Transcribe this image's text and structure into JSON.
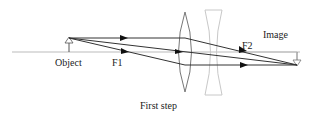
{
  "diagram": {
    "type": "optics-ray-diagram",
    "caption": "First step",
    "labels": {
      "object": "Object",
      "focal_1": "F1",
      "focal_2": "F2",
      "image": "Image"
    },
    "elements": [
      {
        "name": "optical-axis",
        "kind": "line"
      },
      {
        "name": "object-arrow",
        "kind": "arrow-up",
        "x": 69
      },
      {
        "name": "convex-lens",
        "kind": "converging-lens",
        "x": 185
      },
      {
        "name": "concave-lens",
        "kind": "diverging-lens",
        "x": 213
      },
      {
        "name": "image-arrow",
        "kind": "arrow-down",
        "x": 297
      }
    ],
    "rays": [
      {
        "name": "parallel-ray",
        "description": "parallel to axis, refracts through F2"
      },
      {
        "name": "focal-ray",
        "description": "through F1, exits parallel"
      },
      {
        "name": "central-ray",
        "description": "through lens center, undeviated"
      }
    ],
    "colors": {
      "ray": "#333333",
      "axis": "#bbbbbb",
      "convex_lens": "#777777",
      "concave_lens": "#c8c8c8",
      "text": "#222222"
    }
  }
}
